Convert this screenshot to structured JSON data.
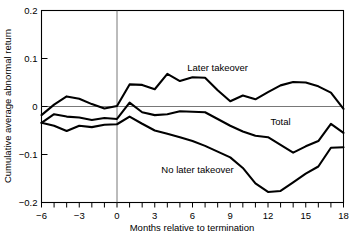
{
  "chart_data": {
    "type": "line",
    "title": "",
    "xlabel": "Months relative to termination",
    "ylabel": "Cumulative average abnormal return",
    "xlim": [
      -6,
      18
    ],
    "ylim": [
      -0.2,
      0.2
    ],
    "xticks": [
      -6,
      -5,
      -4,
      -3,
      -2,
      -1,
      0,
      1,
      2,
      3,
      4,
      5,
      6,
      7,
      8,
      9,
      10,
      11,
      12,
      13,
      14,
      15,
      16,
      17,
      18
    ],
    "xtick_labels": [
      "−6",
      "",
      "",
      "−3",
      "",
      "",
      "0",
      "",
      "",
      "3",
      "",
      "",
      "6",
      "",
      "",
      "9",
      "",
      "",
      "12",
      "",
      "",
      "15",
      "",
      "",
      "18"
    ],
    "yticks": [
      -0.2,
      -0.1,
      0,
      0.1,
      0.2
    ],
    "ytick_labels": [
      "−0.2",
      "−0.1",
      "0",
      "0.1",
      "0.2"
    ],
    "grid": false,
    "legend_position": "inline-annotations",
    "reference_lines": [
      {
        "name": "zero-horizontal",
        "axis": "y",
        "value": 0
      },
      {
        "name": "event-vertical",
        "axis": "x",
        "value": 0
      }
    ],
    "x": [
      -6,
      -5,
      -4,
      -3,
      -2,
      -1,
      0,
      1,
      2,
      3,
      4,
      5,
      6,
      7,
      8,
      9,
      10,
      11,
      12,
      13,
      14,
      15,
      16,
      17,
      18
    ],
    "series": [
      {
        "name": "Later takeover",
        "label": "Later takeover",
        "values": [
          -0.018,
          0.004,
          0.021,
          0.016,
          0.005,
          -0.004,
          0.001,
          0.046,
          0.045,
          0.036,
          0.068,
          0.053,
          0.061,
          0.06,
          0.034,
          0.011,
          0.023,
          0.015,
          0.03,
          0.044,
          0.051,
          0.05,
          0.042,
          0.029,
          -0.005
        ]
      },
      {
        "name": "Total",
        "label": "Total",
        "values": [
          -0.034,
          -0.016,
          -0.021,
          -0.023,
          -0.028,
          -0.024,
          -0.026,
          0.008,
          -0.012,
          -0.018,
          -0.016,
          -0.01,
          -0.011,
          -0.012,
          -0.026,
          -0.04,
          -0.052,
          -0.061,
          -0.064,
          -0.08,
          -0.096,
          -0.083,
          -0.072,
          -0.036,
          -0.055
        ]
      },
      {
        "name": "No later takeover",
        "label": "No later takeover",
        "values": [
          -0.034,
          -0.04,
          -0.051,
          -0.04,
          -0.043,
          -0.038,
          -0.037,
          -0.021,
          -0.036,
          -0.05,
          -0.057,
          -0.064,
          -0.072,
          -0.082,
          -0.094,
          -0.106,
          -0.128,
          -0.16,
          -0.178,
          -0.176,
          -0.158,
          -0.14,
          -0.125,
          -0.086,
          -0.085
        ]
      }
    ],
    "annotations": [
      {
        "text": "Later takeover",
        "x": 8.0,
        "y": 0.073
      },
      {
        "text": "Total",
        "x": 13.0,
        "y": -0.038
      },
      {
        "text": "No later takeover",
        "x": 6.4,
        "y": -0.138
      }
    ]
  }
}
